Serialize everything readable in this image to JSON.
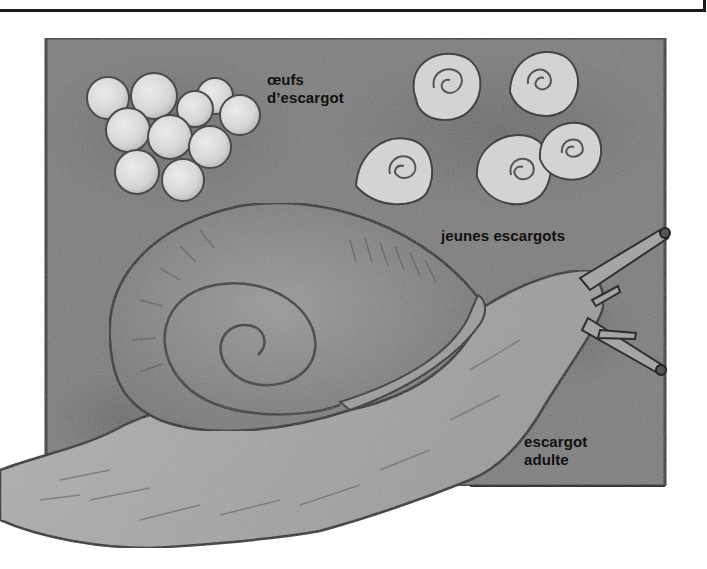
{
  "figure": {
    "colors": {
      "background_panel": "#7c7c7c",
      "panel_border": "#3a3a3a",
      "egg_fill": "#d9d9d9",
      "shell_fill": "#8a8a8a",
      "body_fill": "#a5a5a5",
      "outline": "#2e2e2e",
      "label_text": "#111111"
    },
    "labels": {
      "eggs": {
        "line1": "œufs",
        "line2": "d’escargot"
      },
      "juveniles": {
        "line1": "jeunes escargots"
      },
      "adult": {
        "line1": "escargot",
        "line2": "adulte"
      }
    },
    "counts": {
      "eggs": 10,
      "juvenile_snails": 5
    }
  }
}
